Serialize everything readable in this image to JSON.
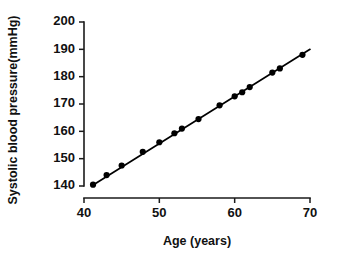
{
  "chart_data": {
    "type": "scatter",
    "title": "",
    "subtitle": "",
    "xlabel": "Age (years)",
    "ylabel": "Systolic blood pressure(mmHg)",
    "xlim": [
      40,
      70
    ],
    "ylim": [
      140,
      200
    ],
    "xticks": [
      40,
      50,
      60,
      70
    ],
    "yticks": [
      140,
      150,
      160,
      170,
      180,
      190,
      200
    ],
    "xtick_labels": [
      "40",
      "50",
      "60",
      "70"
    ],
    "ytick_labels": [
      "140",
      "150",
      "160",
      "170",
      "180",
      "190",
      "200"
    ],
    "grid": false,
    "legend": false,
    "legend_position": "none",
    "marker": "filled-circle",
    "marker_color": "#000000",
    "line_color": "#000000",
    "background_color": "#ffffff",
    "series": [
      {
        "name": "Systolic blood pressure by age",
        "x": [
          41.2,
          43.0,
          45.0,
          47.8,
          50.0,
          52.0,
          53.0,
          55.2,
          58.0,
          60.0,
          61.0,
          62.0,
          65.0,
          66.0,
          69.0
        ],
        "y": [
          140.5,
          144.0,
          147.5,
          152.5,
          156.0,
          159.3,
          161.0,
          164.5,
          169.5,
          172.8,
          174.3,
          176.2,
          181.5,
          183.0,
          188.0
        ]
      }
    ],
    "fit_line": {
      "name": "linear fit",
      "x_start": 41.0,
      "y_start": 140.0,
      "x_end": 70.0,
      "y_end": 190.0
    }
  }
}
